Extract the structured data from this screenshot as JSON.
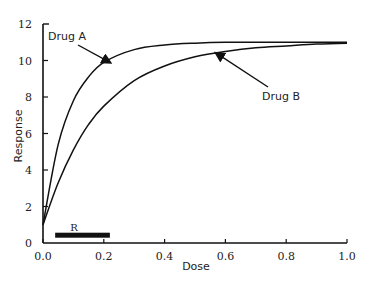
{
  "chart_data": {
    "type": "line",
    "title": "",
    "xlabel": "Dose",
    "ylabel": "Response",
    "xlim": [
      0.0,
      1.0
    ],
    "ylim": [
      0,
      12
    ],
    "xticks": [
      "0.0",
      "0.2",
      "0.4",
      "0.6",
      "0.8",
      "1.0"
    ],
    "yticks": [
      "0",
      "2",
      "4",
      "6",
      "8",
      "10",
      "12"
    ],
    "grid": false,
    "legend": "none (curves labeled by arrow annotations)",
    "x": [
      0.0,
      0.05,
      0.1,
      0.15,
      0.2,
      0.3,
      0.4,
      0.5,
      0.6,
      0.7,
      0.8,
      0.9,
      1.0
    ],
    "series": [
      {
        "name": "Drug A",
        "values": [
          1.0,
          5.4,
          7.8,
          9.1,
          9.9,
          10.6,
          10.85,
          10.95,
          11.0,
          11.0,
          11.0,
          11.0,
          11.0
        ]
      },
      {
        "name": "Drug B",
        "values": [
          1.0,
          3.3,
          5.1,
          6.5,
          7.5,
          8.9,
          9.7,
          10.2,
          10.5,
          10.7,
          10.8,
          10.9,
          10.95
        ]
      }
    ],
    "annotations": [
      {
        "text": "Drug A",
        "arrow_to": {
          "x": 0.22,
          "y": 9.9
        }
      },
      {
        "text": "Drug B",
        "arrow_to": {
          "x": 0.57,
          "y": 10.4
        }
      },
      {
        "text": "R",
        "type": "bar",
        "x_range": [
          0.04,
          0.22
        ],
        "y": 0.4
      }
    ]
  },
  "labels": {
    "x_axis_title": "Dose",
    "y_axis_title": "Response",
    "drug_a": "Drug  A",
    "drug_b": "Drug  B",
    "range_bar": "R"
  }
}
